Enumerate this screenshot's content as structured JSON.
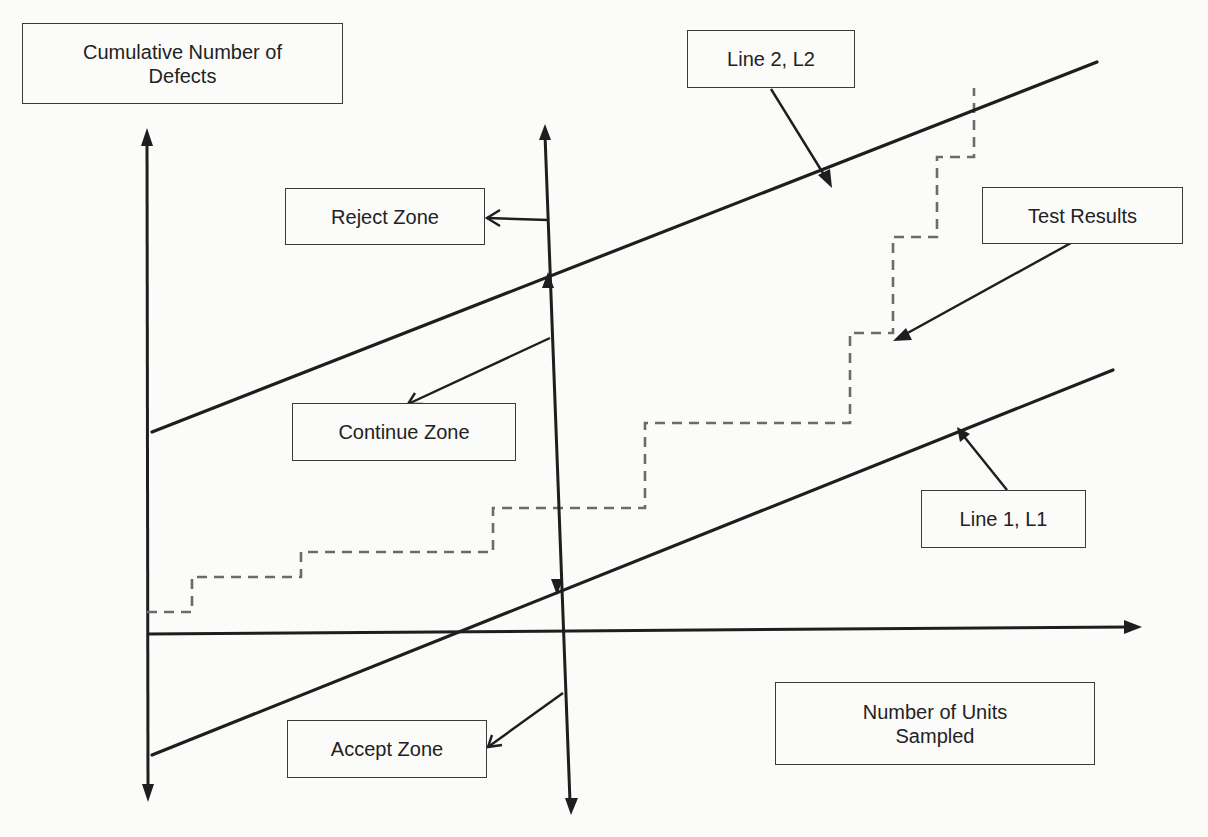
{
  "diagram": {
    "labels": {
      "y_axis": {
        "line1": "Cumulative Number of",
        "line2": "Defects"
      },
      "x_axis": {
        "line1": "Number of Units",
        "line2": "Sampled"
      },
      "line2": "Line 2, L2",
      "line1": "Line 1, L1",
      "reject_zone": "Reject Zone",
      "continue_zone": "Continue Zone",
      "accept_zone": "Accept Zone",
      "test_results": "Test Results"
    },
    "colors": {
      "line": "#1e1e1e",
      "dashed_results": "#6b6b6b",
      "background": "#fbfbf9",
      "box_border": "#3a3a3a"
    },
    "elements": {
      "y_axis": {
        "x": 147,
        "y_top": 130,
        "y_bottom": 800
      },
      "x_axis": {
        "y": 634,
        "x_left": 147,
        "x_right": 1140
      },
      "line_l2": {
        "x1": 152,
        "y1": 432,
        "x2": 1097,
        "y2": 62
      },
      "line_l1": {
        "x1": 152,
        "y1": 755,
        "x2": 1113,
        "y2": 370
      },
      "zone_divider": {
        "x_top": 545,
        "y_top": 125,
        "x_bottom": 571,
        "y_bottom": 815
      },
      "test_results_staircase": [
        [
          147,
          612
        ],
        [
          192,
          612
        ],
        [
          192,
          577
        ],
        [
          301,
          577
        ],
        [
          301,
          552
        ],
        [
          493,
          552
        ],
        [
          493,
          508
        ],
        [
          645,
          508
        ],
        [
          645,
          423
        ],
        [
          850,
          423
        ],
        [
          850,
          333
        ],
        [
          893,
          333
        ],
        [
          893,
          237
        ],
        [
          937,
          237
        ],
        [
          937,
          157
        ],
        [
          974,
          157
        ],
        [
          974,
          88
        ]
      ]
    }
  }
}
